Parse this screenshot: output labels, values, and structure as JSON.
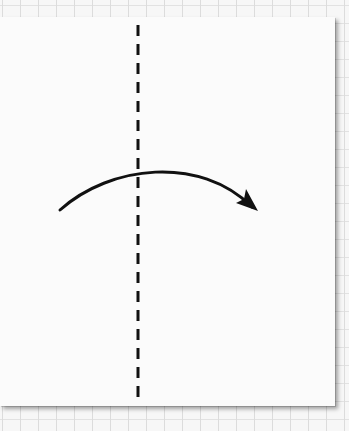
{
  "diagram": {
    "type": "origami-fold-instruction",
    "background": "grid-paper",
    "paper": {
      "shape": "square",
      "color": "#fbfbfb"
    },
    "fold_line": {
      "style": "dashed",
      "orientation": "vertical",
      "x": 138,
      "color": "#111111",
      "label": "valley-fold-line"
    },
    "arrow": {
      "direction": "left-to-right",
      "shape": "curved",
      "color": "#111111",
      "meaning": "fold-over"
    }
  },
  "colors": {
    "grid": "#dcdcdc",
    "ink": "#111111",
    "paper": "#fbfbfb"
  }
}
